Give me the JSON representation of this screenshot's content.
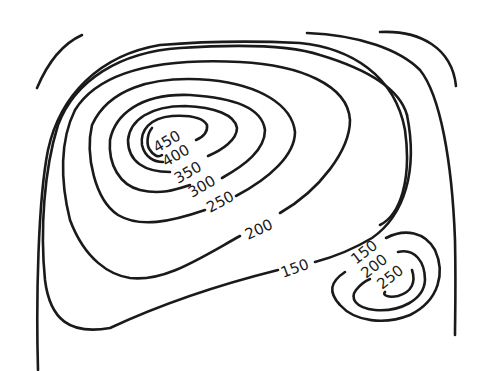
{
  "colors": {
    "line": "#1a1a1a",
    "background": "#ffffff"
  },
  "peaks": [
    {
      "name": "main-peak",
      "contours": [
        "200",
        "250",
        "300",
        "350",
        "400",
        "450"
      ]
    },
    {
      "name": "secondary-peak",
      "contours": [
        "150",
        "200",
        "250"
      ]
    }
  ],
  "labels": {
    "main": {
      "l450": "450",
      "l400": "400",
      "l350": "350",
      "l300": "300",
      "l250": "250",
      "l200": "200",
      "l150": "150"
    },
    "secondary": {
      "l150": "150",
      "l200": "200",
      "l250": "250"
    }
  }
}
